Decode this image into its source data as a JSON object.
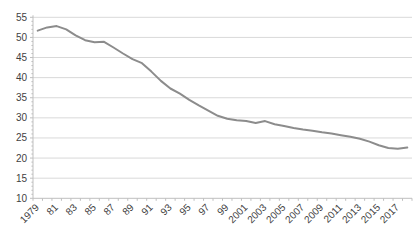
{
  "chart_data": {
    "type": "line",
    "title": "",
    "xlabel": "",
    "ylabel": "",
    "legend": "none",
    "grid": true,
    "ylim": [
      10,
      55
    ],
    "yticks": [
      10,
      15,
      20,
      25,
      30,
      35,
      40,
      45,
      50,
      55
    ],
    "x": [
      1979,
      1980,
      1981,
      1982,
      1983,
      1984,
      1985,
      1986,
      1987,
      1988,
      1989,
      1990,
      1991,
      1992,
      1993,
      1994,
      1995,
      1996,
      1997,
      1998,
      1999,
      2000,
      2001,
      2002,
      2003,
      2004,
      2005,
      2006,
      2007,
      2008,
      2009,
      2010,
      2011,
      2012,
      2013,
      2014,
      2015,
      2016,
      2017,
      2018
    ],
    "values": [
      51.7,
      52.5,
      52.8,
      52.0,
      50.5,
      49.3,
      48.8,
      48.9,
      47.5,
      46.0,
      44.6,
      43.6,
      41.5,
      39.2,
      37.3,
      36.0,
      34.5,
      33.1,
      31.8,
      30.5,
      29.8,
      29.4,
      29.2,
      28.7,
      29.2,
      28.4,
      28.0,
      27.5,
      27.1,
      26.8,
      26.4,
      26.1,
      25.7,
      25.3,
      24.8,
      24.1,
      23.2,
      22.5,
      22.3,
      22.6
    ],
    "xtick_labels": [
      "1979",
      "81",
      "83",
      "85",
      "87",
      "89",
      "91",
      "93",
      "95",
      "97",
      "99",
      "2001",
      "2003",
      "2005",
      "2007",
      "2009",
      "2011",
      "2013",
      "2015",
      "2017"
    ],
    "colors": {
      "line": "#8c8c8c",
      "gridline": "#d9d9d9",
      "axis": "#bfbfbf",
      "tick": "#bfbfbf",
      "label": "#3f3f3f",
      "background": "#ffffff"
    }
  }
}
